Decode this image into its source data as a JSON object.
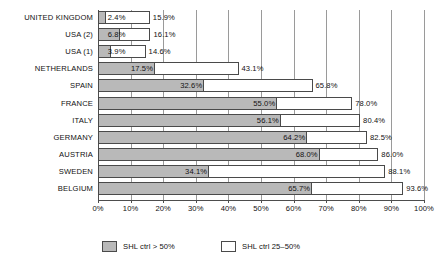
{
  "chart_data": {
    "type": "bar",
    "orientation": "horizontal",
    "title": "",
    "subtitle": "",
    "xlabel": "",
    "ylabel": "",
    "xlim": [
      0,
      100
    ],
    "xtick_labels": [
      "0%",
      "10%",
      "20%",
      "30%",
      "40%",
      "50%",
      "60%",
      "70%",
      "80%",
      "90%",
      "100%"
    ],
    "xtick_values": [
      0,
      10,
      20,
      30,
      40,
      50,
      60,
      70,
      80,
      90,
      100
    ],
    "grid": true,
    "grid_axis": "x",
    "legend_position": "bottom",
    "categories": [
      "UNITED KINGDOM",
      "USA (2)",
      "USA (1)",
      "NETHERLANDS",
      "SPAIN",
      "FRANCE",
      "ITALY",
      "GERMANY",
      "AUSTRIA",
      "SWEDEN",
      "BELGIUM"
    ],
    "series": [
      {
        "name": "SHL ctrl > 50%",
        "color": "#b9b9b9",
        "values": [
          2.4,
          6.8,
          3.9,
          17.5,
          32.6,
          55.0,
          56.1,
          64.2,
          68.0,
          34.1,
          65.7
        ],
        "labels": [
          "2.4%",
          "6.8%",
          "3.9%",
          "17.5%",
          "32.6%",
          "55.0%",
          "56.1%",
          "64.2%",
          "68.0%",
          "34.1%",
          "65.7%"
        ]
      },
      {
        "name": "SHL ctrl 25–50%",
        "color": "#ffffff",
        "values": [
          15.9,
          16.1,
          14.6,
          43.1,
          65.8,
          78.0,
          80.4,
          82.5,
          86.0,
          88.1,
          93.6
        ],
        "labels": [
          "15.9%",
          "16.1%",
          "14.6%",
          "43.1%",
          "65.8%",
          "78.0%",
          "80.4%",
          "82.5%",
          "86.0%",
          "88.1%",
          "93.6%"
        ]
      }
    ]
  },
  "legend": {
    "items": [
      {
        "label": "SHL ctrl > 50%",
        "swatch": "filled"
      },
      {
        "label": "SHL ctrl 25–50%",
        "swatch": "hollow"
      }
    ]
  }
}
